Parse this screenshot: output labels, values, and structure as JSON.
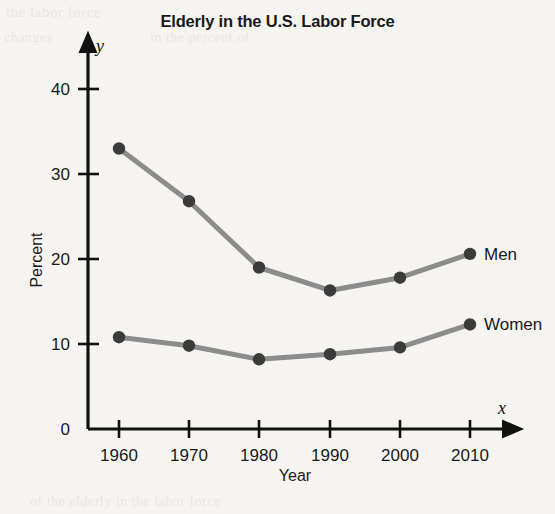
{
  "figure": {
    "title": "Elderly in the U.S. Labor Force",
    "y_axis_letter": "y",
    "x_axis_letter": "x",
    "x_axis_title": "Year",
    "y_axis_title": "Percent",
    "line_color": "#8c8c8c",
    "marker_color": "#3b3b3b",
    "axis_color": "#111111",
    "background_color": "#f6f4f1"
  },
  "ghost_text": {
    "top_left": "the labor force",
    "top_mid": "in the percent of",
    "mid_left": "changes",
    "bottom": "of the elderly in the labor force"
  },
  "chart_data": {
    "type": "line",
    "title": "Elderly in the U.S. Labor Force",
    "xlabel": "Year",
    "ylabel": "Percent",
    "categories": [
      "1960",
      "1970",
      "1980",
      "1990",
      "2000",
      "2010"
    ],
    "x": [
      1960,
      1970,
      1980,
      1990,
      2000,
      2010
    ],
    "xlim": [
      1955,
      2015
    ],
    "ylim": [
      0,
      44
    ],
    "y_ticks": [
      "0",
      "10",
      "20",
      "30",
      "40"
    ],
    "y_tick_values": [
      0,
      10,
      20,
      30,
      40
    ],
    "grid": false,
    "legend_position": "end-of-line-labels",
    "series": [
      {
        "name": "Men",
        "values": [
          33.0,
          26.8,
          19.0,
          16.3,
          17.8,
          20.6
        ]
      },
      {
        "name": "Women",
        "values": [
          10.8,
          9.8,
          8.2,
          8.8,
          9.6,
          12.3
        ]
      }
    ]
  }
}
